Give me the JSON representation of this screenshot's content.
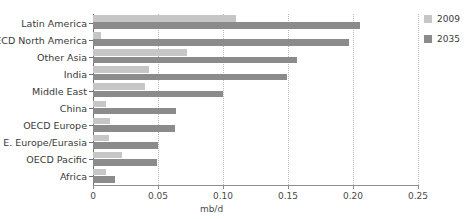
{
  "chart_data": {
    "type": "bar",
    "orientation": "horizontal",
    "title": "",
    "xlabel": "mb/d",
    "ylabel": "",
    "xlim": [
      0,
      0.25
    ],
    "xticks": [
      0,
      0.05,
      0.1,
      0.15,
      0.2,
      0.25
    ],
    "xtick_labels": [
      "0",
      "0.05",
      "0.10",
      "0.15",
      "0.20",
      "0.25"
    ],
    "grid": true,
    "grid_axis": "x",
    "legend_position": "right",
    "categories": [
      "Latin America",
      "OECD North America",
      "Other Asia",
      "India",
      "Middle East",
      "China",
      "OECD Europe",
      "E. Europe/Eurasia",
      "OECD Pacific",
      "Africa"
    ],
    "series": [
      {
        "name": "2009",
        "color": "#c6c6c6",
        "values": [
          0.11,
          0.006,
          0.072,
          0.043,
          0.04,
          0.01,
          0.013,
          0.012,
          0.022,
          0.01
        ]
      },
      {
        "name": "2035",
        "color": "#8b8b8b",
        "values": [
          0.205,
          0.197,
          0.157,
          0.149,
          0.1,
          0.064,
          0.063,
          0.05,
          0.049,
          0.017
        ]
      }
    ]
  },
  "legend": {
    "items": [
      {
        "label": "2009",
        "color": "#c6c6c6"
      },
      {
        "label": "2035",
        "color": "#8b8b8b"
      }
    ]
  },
  "axis": {
    "x_title": "mb/d"
  }
}
